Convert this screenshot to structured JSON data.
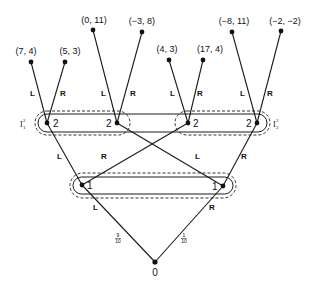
{
  "diagram": {
    "type": "extensive-form game tree",
    "root": {
      "label": "0",
      "player": "chance"
    },
    "chance_moves": [
      {
        "action": "L",
        "probability_num": "9",
        "probability_den": "10"
      },
      {
        "action": "R",
        "probability_num": "1",
        "probability_den": "10"
      }
    ],
    "player1_nodes": [
      {
        "label": "1",
        "actions": [
          "L",
          "R"
        ]
      },
      {
        "label": "1",
        "actions": [
          "L",
          "R"
        ]
      }
    ],
    "player2_nodes": [
      {
        "label": "2",
        "actions": [
          "L",
          "R"
        ]
      },
      {
        "label": "2",
        "actions": [
          "L",
          "R"
        ]
      },
      {
        "label": "2",
        "actions": [
          "L",
          "R"
        ]
      },
      {
        "label": "2",
        "actions": [
          "L",
          "R"
        ]
      }
    ],
    "information_sets": {
      "left": {
        "base": "I",
        "sup": "2",
        "sub": "1"
      },
      "right": {
        "base": "I",
        "sup": "2",
        "sub": "2"
      }
    },
    "payoffs": [
      "(7, 4)",
      "(5, 3)",
      "(0, 11)",
      "(−3, 8)",
      "(4, 3)",
      "(17, 4)",
      "(−8, 11)",
      "(−2, −2)"
    ],
    "edge_labels": {
      "L": "L",
      "R": "R"
    }
  }
}
